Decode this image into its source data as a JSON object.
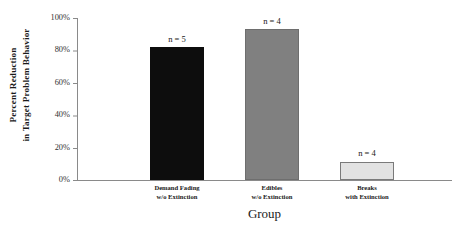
{
  "chart_data": {
    "type": "bar",
    "title": "",
    "categories": [
      "Demand Fading w/o Extinction",
      "Edibles w/o Extinction",
      "Breaks with Extinction"
    ],
    "category_lines": [
      [
        "Demand Fading",
        "w/o Extinction"
      ],
      [
        "Edibles",
        "w/o Extinction"
      ],
      [
        "Breaks",
        "with Extinction"
      ]
    ],
    "values": [
      82,
      93,
      11
    ],
    "point_labels": [
      "n = 5",
      "n = 4",
      "n = 4"
    ],
    "bar_colors": [
      "#0d0d0d",
      "#808080",
      "#e2e2e2"
    ],
    "bar_border_colors": [
      "#0d0d0d",
      "#6e6e6e",
      "#7a7a7a"
    ],
    "xlabel": "Group",
    "ylabel": "Percent Reduction in Target Problem Behavior",
    "ylabel_lines": [
      "Percent Reduction",
      "in Target Problem Behavior"
    ],
    "ylim": [
      0,
      100
    ],
    "ytick_values": [
      0,
      20,
      40,
      60,
      80,
      100
    ],
    "ytick_labels": [
      "0%",
      "20%",
      "40%",
      "60%",
      "80%",
      "100%"
    ],
    "grid": false,
    "legend": false,
    "axis_color": "#8a8a8a"
  }
}
